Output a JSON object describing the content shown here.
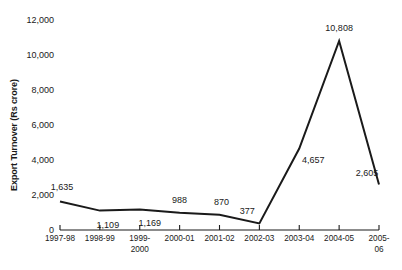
{
  "chart_data": {
    "type": "line",
    "title": "",
    "xlabel": "",
    "ylabel": "Export Turnover (Rs crore)",
    "categories": [
      "1997-98",
      "1998-99",
      "1999-\n2000",
      "2000-01",
      "2001-02",
      "2002-03",
      "2003-04",
      "2004-05",
      "2005-\n06"
    ],
    "values": [
      1635,
      1109,
      1169,
      988,
      870,
      377,
      4657,
      10808,
      2605
    ],
    "point_labels": [
      "1,635",
      "1,109",
      "1,169",
      "988",
      "870",
      "377",
      "4,657",
      "10,808",
      "2,605"
    ],
    "yticks": [
      0,
      2000,
      4000,
      6000,
      8000,
      10000,
      12000
    ],
    "ytick_labels": [
      "0",
      "2,000",
      "4,000",
      "6,000",
      "8,000",
      "10,000",
      "12,000"
    ],
    "ylim": [
      0,
      12000
    ],
    "grid": false,
    "legend": "none",
    "line_color": "#1a1a1a",
    "background_color": "#ffffff"
  }
}
